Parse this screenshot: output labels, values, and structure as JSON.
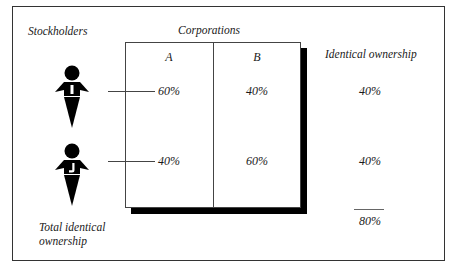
{
  "diagram": {
    "headers": {
      "stockholders": "Stockholders",
      "corporations": "Corporations",
      "identical_ownership": "Identical ownership"
    },
    "corporations": [
      {
        "label": "A"
      },
      {
        "label": "B"
      }
    ],
    "stockholders": [
      {
        "id": "I",
        "ownership": {
          "A": "60%",
          "B": "40%"
        },
        "identical": "40%"
      },
      {
        "id": "J",
        "ownership": {
          "A": "40%",
          "B": "60%"
        },
        "identical": "40%"
      }
    ],
    "total": {
      "label_line1": "Total identical",
      "label_line2": "ownership",
      "value": "80%"
    }
  }
}
